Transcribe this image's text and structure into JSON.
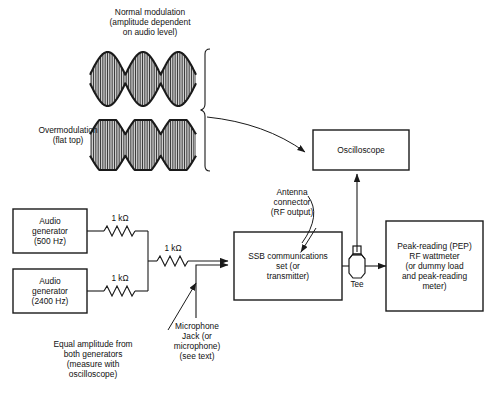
{
  "figure": {
    "type": "block-diagram"
  },
  "waveforms": {
    "normal": {
      "caption_line1": "Normal modulation",
      "caption_line2": "(amplitude dependent",
      "caption_line3": "on audio level)",
      "envelope": "sinusoidal",
      "lobes": 3
    },
    "over": {
      "caption_line1": "Overmodulation",
      "caption_line2": "(flat top)",
      "envelope": "flat-topped",
      "lobes": 3
    }
  },
  "blocks": {
    "oscilloscope": {
      "label": "Oscilloscope"
    },
    "audio_gen_1": {
      "line1": "Audio",
      "line2": "generator",
      "line3": "(500 Hz)"
    },
    "audio_gen_2": {
      "line1": "Audio",
      "line2": "generator",
      "line3": "(2400 Hz)"
    },
    "ssb_set": {
      "line1": "SSB communications",
      "line2": "set (or",
      "line3": "transmitter)"
    },
    "wattmeter": {
      "line1": "Peak-reading (PEP)",
      "line2": "RF wattmeter",
      "line3": "(or dummy load",
      "line4": "and peak-reading",
      "line5": "meter)"
    }
  },
  "components": {
    "resistor_top": "1 kΩ",
    "resistor_bottom": "1 kΩ",
    "resistor_mid": "1 kΩ",
    "tee": "Tee"
  },
  "annotations": {
    "antenna": {
      "line1": "Antenna",
      "line2": "connector",
      "line3": "(RF output)"
    },
    "mic": {
      "line1": "Microphone",
      "line2": "Jack (or",
      "line3": "microphone)",
      "line4": "(see text)"
    },
    "equal_amplitude": {
      "line1": "Equal amplitude from",
      "line2": "both generators",
      "line3": "(measure with",
      "line4": "oscilloscope)"
    }
  },
  "colors": {
    "line": "#1a1a1a",
    "text": "#111111",
    "background": "#ffffff"
  }
}
